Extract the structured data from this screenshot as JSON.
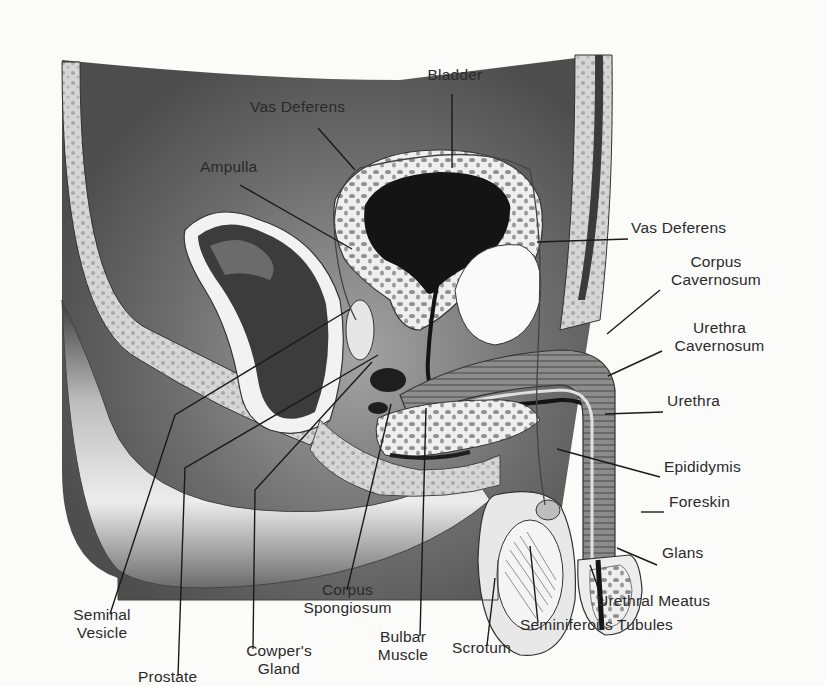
{
  "diagram": {
    "type": "anatomical-cross-section",
    "colors": {
      "background": "#fbfbfa",
      "ink": "#1e1e1e",
      "label_text": "#2a2a2a",
      "tissue_dark": "#2b2b2b",
      "tissue_mid": "#8a8a8a",
      "tissue_light": "#d9d9d9",
      "cavity_white": "#f7f7f7"
    }
  },
  "labels": [
    {
      "id": "bladder",
      "lines": [
        "Bladder"
      ],
      "x": 420,
      "y": 88,
      "align": "center",
      "w": 70,
      "leader": [
        [
          452,
          106
        ],
        [
          452,
          190
        ]
      ]
    },
    {
      "id": "vas-deferens-top",
      "lines": [
        "Vas Deferens"
      ],
      "x": 250,
      "y": 125,
      "align": "left",
      "w": 110,
      "leader": [
        [
          318,
          145
        ],
        [
          355,
          192
        ]
      ]
    },
    {
      "id": "ampulla",
      "lines": [
        "Ampulla"
      ],
      "x": 200,
      "y": 193,
      "align": "left",
      "w": 80,
      "leader": [
        [
          240,
          210
        ],
        [
          352,
          282
        ]
      ]
    },
    {
      "id": "vas-deferens-right",
      "lines": [
        "Vas Deferens"
      ],
      "x": 631,
      "y": 262,
      "align": "left",
      "w": 110,
      "leader": [
        [
          537,
          274
        ],
        [
          628,
          271
        ]
      ]
    },
    {
      "id": "corpus-cavernosum",
      "lines": [
        "Corpus",
        "Cavernosum"
      ],
      "x": 660,
      "y": 300,
      "align": "center",
      "w": 112,
      "leader": [
        [
          660,
          328
        ],
        [
          607,
          378
        ]
      ]
    },
    {
      "id": "urethra-cavernosum",
      "lines": [
        "Urethra",
        "Cavernosum"
      ],
      "x": 662,
      "y": 375,
      "align": "center",
      "w": 115,
      "leader": [
        [
          662,
          398
        ],
        [
          608,
          426
        ]
      ]
    },
    {
      "id": "urethra",
      "lines": [
        "Urethra"
      ],
      "x": 667,
      "y": 457,
      "align": "left",
      "w": 70,
      "leader": [
        [
          605,
          469
        ],
        [
          663,
          467
        ]
      ]
    },
    {
      "id": "epididymis",
      "lines": [
        "Epididymis"
      ],
      "x": 664,
      "y": 532,
      "align": "left",
      "w": 100,
      "leader": [
        [
          557,
          508
        ],
        [
          660,
          540
        ]
      ]
    },
    {
      "id": "foreskin",
      "lines": [
        "Foreskin"
      ],
      "x": 669,
      "y": 572,
      "align": "left",
      "w": 80,
      "leader": [
        [
          641,
          580
        ],
        [
          664,
          580
        ]
      ]
    },
    {
      "id": "glans",
      "lines": [
        "Glans"
      ],
      "x": 662,
      "y": 630,
      "align": "left",
      "w": 60,
      "leader": [
        [
          617,
          620
        ],
        [
          657,
          640
        ]
      ]
    },
    {
      "id": "urethral-meatus",
      "lines": [
        "Urethral Meatus"
      ],
      "x": 597,
      "y": 684,
      "align": "left",
      "w": 150,
      "leader": [
        [
          590,
          640
        ],
        [
          603,
          680
        ]
      ]
    },
    {
      "id": "seminiferous-tubules",
      "lines": [
        "Seminiferous Tubules"
      ],
      "x": 520,
      "y": 711,
      "align": "left",
      "w": 190,
      "leader": [
        [
          530,
          618
        ],
        [
          538,
          706
        ]
      ]
    },
    {
      "id": "scrotum",
      "lines": [
        "Scrotum"
      ],
      "x": 452,
      "y": 737,
      "align": "left",
      "w": 80,
      "leader": [
        [
          495,
          655
        ],
        [
          487,
          730
        ]
      ]
    },
    {
      "id": "bulbar-muscle",
      "lines": [
        "Bulbar",
        "Muscle"
      ],
      "x": 368,
      "y": 725,
      "align": "center",
      "w": 70,
      "leader": [
        [
          426,
          462
        ],
        [
          420,
          720
        ]
      ]
    },
    {
      "id": "corpus-spongiosum",
      "lines": [
        "Corpus",
        "Spongiosum"
      ],
      "x": 295,
      "y": 672,
      "align": "center",
      "w": 105,
      "leader": [
        [
          391,
          458
        ],
        [
          347,
          668
        ]
      ]
    },
    {
      "id": "cowpers-gland",
      "lines": [
        "Cowper's",
        "Gland"
      ],
      "x": 238,
      "y": 740,
      "align": "center",
      "w": 82,
      "leader": [
        [
          372,
          410
        ],
        [
          255,
          555
        ],
        [
          253,
          735
        ]
      ]
    },
    {
      "id": "seminal-vesicle",
      "lines": [
        "Seminal",
        "Vesicle"
      ],
      "x": 66,
      "y": 700,
      "align": "center",
      "w": 72,
      "leader": [
        [
          350,
          350
        ],
        [
          175,
          470
        ],
        [
          110,
          695
        ]
      ]
    },
    {
      "id": "prostate",
      "lines": [
        "Prostate"
      ],
      "x": 138,
      "y": 770,
      "align": "left",
      "w": 75,
      "leader": [
        [
          378,
          402
        ],
        [
          185,
          530
        ],
        [
          178,
          765
        ]
      ]
    }
  ]
}
